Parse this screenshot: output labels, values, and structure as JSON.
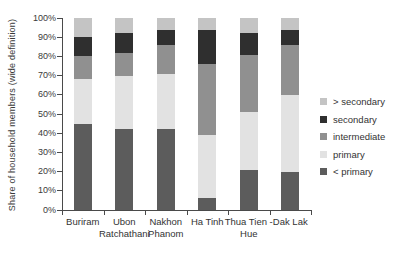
{
  "chart": {
    "ylabel": "Share of household members (wide definition)"
  },
  "chart_data": {
    "type": "bar",
    "stacked": true,
    "title": "",
    "xlabel": "",
    "ylabel": "Share of household members (wide definition)",
    "ylim": [
      0,
      100
    ],
    "grid": false,
    "legend_position": "right",
    "y_tick_labels": [
      "0%",
      "10%",
      "20%",
      "30%",
      "40%",
      "50%",
      "60%",
      "70%",
      "80%",
      "90%",
      "100%"
    ],
    "categories": [
      "Buriram",
      "Ubon Ratchathani",
      "Nakhon Phanom",
      "Ha Tinh",
      "Thua Tien - Hue",
      "Dak Lak"
    ],
    "series": [
      {
        "name": "< primary",
        "color": "#5c5c5c",
        "values": [
          45,
          42,
          42,
          6,
          21,
          20
        ]
      },
      {
        "name": "primary",
        "color": "#e2e2e2",
        "values": [
          23,
          28,
          29,
          33,
          30,
          40
        ]
      },
      {
        "name": "intermediate",
        "color": "#909090",
        "values": [
          12,
          12,
          15,
          37,
          30,
          26
        ]
      },
      {
        "name": "secondary",
        "color": "#2f2f2f",
        "values": [
          10,
          10,
          8,
          18,
          11,
          8
        ]
      },
      {
        "name": "> secondary",
        "color": "#c4c4c4",
        "values": [
          10,
          8,
          6,
          6,
          8,
          6
        ]
      }
    ],
    "legend_order_top_to_bottom": [
      "> secondary",
      "secondary",
      "intermediate",
      "primary",
      "< primary"
    ]
  }
}
